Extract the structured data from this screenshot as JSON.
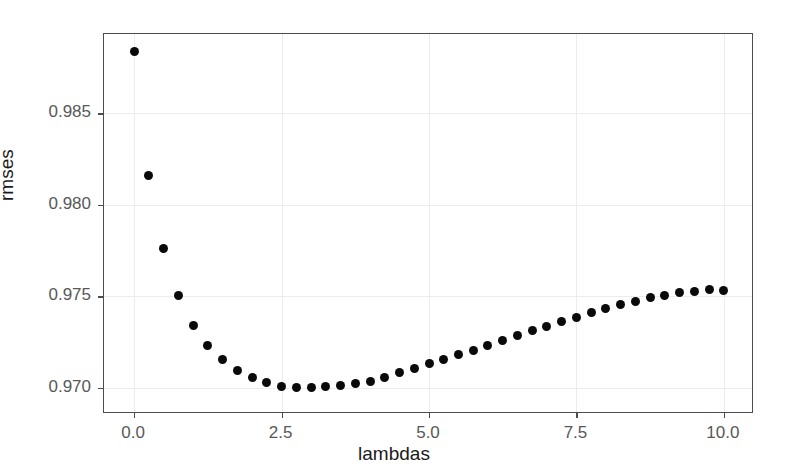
{
  "chart_data": {
    "type": "scatter",
    "title": "",
    "subtitle": "",
    "xlabel": "lambdas",
    "ylabel": "rmses",
    "xlim": [
      -0.51,
      10.51
    ],
    "ylim": [
      0.96855,
      0.98935
    ],
    "grid": true,
    "legend": null,
    "legend_position": "none",
    "marker": {
      "shape": "circle",
      "color": "#0a0a0a",
      "size": 9
    },
    "xticks": [
      0.0,
      2.5,
      5.0,
      7.5,
      10.0
    ],
    "xticklabels": [
      "0.0",
      "2.5",
      "5.0",
      "7.5",
      "10.0"
    ],
    "yticks": [
      0.97,
      0.975,
      0.98,
      0.985
    ],
    "yticklabels": [
      "0.970",
      "0.975",
      "0.980",
      "0.985"
    ],
    "x": [
      0.0,
      0.25,
      0.5,
      0.75,
      1.0,
      1.25,
      1.5,
      1.75,
      2.0,
      2.25,
      2.5,
      2.75,
      3.0,
      3.25,
      3.5,
      3.75,
      4.0,
      4.25,
      4.5,
      4.75,
      5.0,
      5.25,
      5.5,
      5.75,
      6.0,
      6.25,
      6.5,
      6.75,
      7.0,
      7.25,
      7.5,
      7.75,
      8.0,
      8.25,
      8.5,
      8.75,
      9.0,
      9.25,
      9.5,
      9.75,
      10.0
    ],
    "y": [
      0.9884,
      0.9816,
      0.9776,
      0.97505,
      0.9734,
      0.9723,
      0.97155,
      0.97095,
      0.97055,
      0.97025,
      0.97008,
      0.97,
      0.97,
      0.97003,
      0.9701,
      0.9702,
      0.97035,
      0.97055,
      0.9708,
      0.97105,
      0.9713,
      0.97155,
      0.9718,
      0.97205,
      0.97232,
      0.97258,
      0.97285,
      0.9731,
      0.97335,
      0.9736,
      0.97385,
      0.97408,
      0.9743,
      0.97452,
      0.97472,
      0.9749,
      0.97505,
      0.97518,
      0.97528,
      0.97535,
      0.9753
    ],
    "series": [
      {
        "name": "rmses",
        "values": [
          0.9884,
          0.9816,
          0.9776,
          0.97505,
          0.9734,
          0.9723,
          0.97155,
          0.97095,
          0.97055,
          0.97025,
          0.97008,
          0.97,
          0.97,
          0.97003,
          0.9701,
          0.9702,
          0.97035,
          0.97055,
          0.9708,
          0.97105,
          0.9713,
          0.97155,
          0.9718,
          0.97205,
          0.97232,
          0.97258,
          0.97285,
          0.9731,
          0.97335,
          0.9736,
          0.97385,
          0.97408,
          0.9743,
          0.97452,
          0.97472,
          0.9749,
          0.97505,
          0.97518,
          0.97528,
          0.97535,
          0.9753
        ]
      }
    ],
    "n_points": 41,
    "colors": {
      "point": "#0a0a0a",
      "panel_border": "#4d4d4d",
      "grid": "#ececec",
      "tick_label": "#585858",
      "axis_title": "#1a1a1a",
      "background": "#ffffff"
    }
  }
}
